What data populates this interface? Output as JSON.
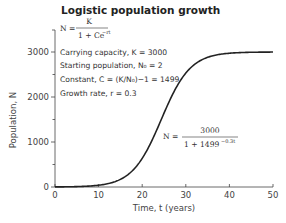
{
  "chart_data": {
    "type": "line",
    "title": "Logistic population growth",
    "xlabel": "Time, t (years)",
    "ylabel": "Population, N",
    "xlim": [
      0,
      50
    ],
    "ylim": [
      0,
      3000
    ],
    "x_ticks": [
      0,
      10,
      20,
      30,
      40,
      50
    ],
    "x_tick_labels": [
      "0",
      "10",
      "20",
      "30",
      "40",
      "50"
    ],
    "y_ticks": [
      0,
      1000,
      2000,
      3000
    ],
    "y_tick_labels": [
      "0",
      "1000",
      "2000",
      "3000"
    ],
    "y_minor_ticks": [
      500,
      1500,
      2500
    ],
    "grid": false,
    "series": [
      {
        "name": "N(t) = 3000 / (1 + 1499 e^(-0.3t))",
        "model": {
          "K": 3000,
          "C": 1499,
          "r": 0.3
        },
        "x": [
          0,
          5,
          10,
          15,
          20,
          22,
          24,
          26,
          28,
          30,
          35,
          40,
          45,
          50
        ],
        "values": [
          2,
          9,
          40,
          175,
          692,
          1199,
          1823,
          2395,
          2756,
          2927,
          2991,
          2999,
          3000,
          3000
        ]
      }
    ],
    "annotations": {
      "general_formula": {
        "lhs": "N =",
        "numerator": "K",
        "denominator": "1 + Ce",
        "exponent": "−rt"
      },
      "parameters": [
        "Carrying capacity, K = 3000",
        "Starting population, N₀ = 2",
        "Constant, C = (K/N₀)−1 = 1499",
        "Growth rate, r = 0.3"
      ],
      "specific_formula": {
        "lhs": "N =",
        "numerator": "3000",
        "denominator": "1 + 1499",
        "exponent": "−0.3t"
      }
    }
  }
}
